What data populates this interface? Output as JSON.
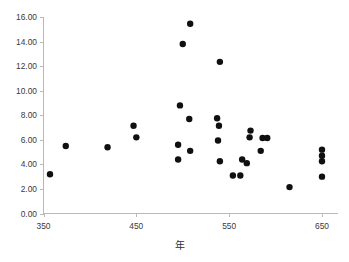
{
  "chart_data": {
    "type": "scatter",
    "title": "",
    "xlabel": "年",
    "ylabel": "",
    "xlim": [
      350,
      670
    ],
    "ylim": [
      0.0,
      16.6
    ],
    "xticks": [
      350,
      450,
      550,
      650
    ],
    "xtick_labels": [
      "350",
      "450",
      "550",
      "650"
    ],
    "yticks": [
      0.0,
      2.0,
      4.0,
      6.0,
      8.0,
      10.0,
      12.0,
      14.0,
      16.0
    ],
    "ytick_labels": [
      "0.00",
      "2.00",
      "4.00",
      "6.00",
      "8.00",
      "10.00",
      "12.00",
      "14.00",
      "16.00"
    ],
    "grid": false,
    "legend": false,
    "marker": "filled-circle",
    "marker_color": "#101010",
    "marker_size": 4.4,
    "points": [
      {
        "x": 357,
        "y": 3.2
      },
      {
        "x": 374,
        "y": 5.5
      },
      {
        "x": 419,
        "y": 5.4
      },
      {
        "x": 447,
        "y": 7.15
      },
      {
        "x": 450,
        "y": 6.2
      },
      {
        "x": 500,
        "y": 13.8
      },
      {
        "x": 508,
        "y": 15.45
      },
      {
        "x": 497,
        "y": 8.8
      },
      {
        "x": 495,
        "y": 5.6
      },
      {
        "x": 495,
        "y": 4.4
      },
      {
        "x": 507,
        "y": 7.7
      },
      {
        "x": 508,
        "y": 5.1
      },
      {
        "x": 540,
        "y": 12.35
      },
      {
        "x": 537,
        "y": 7.75
      },
      {
        "x": 539,
        "y": 7.15
      },
      {
        "x": 538,
        "y": 5.95
      },
      {
        "x": 540,
        "y": 4.25
      },
      {
        "x": 554,
        "y": 3.1
      },
      {
        "x": 562,
        "y": 3.1
      },
      {
        "x": 564,
        "y": 4.4
      },
      {
        "x": 569,
        "y": 4.1
      },
      {
        "x": 573,
        "y": 6.75
      },
      {
        "x": 572,
        "y": 6.2
      },
      {
        "x": 586,
        "y": 6.15
      },
      {
        "x": 591,
        "y": 6.15
      },
      {
        "x": 584,
        "y": 5.1
      },
      {
        "x": 615,
        "y": 2.15
      },
      {
        "x": 650,
        "y": 5.2
      },
      {
        "x": 650,
        "y": 4.7
      },
      {
        "x": 650,
        "y": 4.25
      },
      {
        "x": 650,
        "y": 3.0
      }
    ]
  },
  "axes": {
    "x_axis_name": "x-axis",
    "y_axis_name": "y-axis"
  }
}
